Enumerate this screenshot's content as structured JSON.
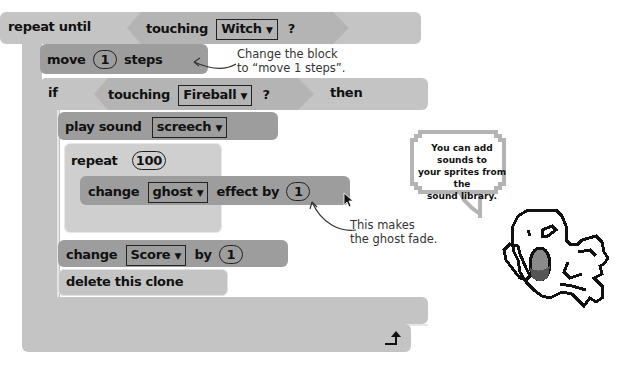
{
  "script": {
    "repeat_until": {
      "label": "repeat until",
      "condition": {
        "label": "touching",
        "target": "Witch",
        "suffix": "?"
      }
    },
    "move": {
      "label": "move",
      "value": "1",
      "suffix": "steps"
    },
    "if_block": {
      "label": "if",
      "condition": {
        "label": "touching",
        "target": "Fireball",
        "suffix": "?"
      },
      "then_label": "then"
    },
    "play_sound": {
      "label": "play sound",
      "sound": "screech"
    },
    "repeat": {
      "label": "repeat",
      "value": "100"
    },
    "change_effect": {
      "label": "change",
      "effect": "ghost",
      "middle": "effect by",
      "value": "1"
    },
    "change_var": {
      "label": "change",
      "variable": "Score",
      "middle": "by",
      "value": "1"
    },
    "delete_clone": {
      "label": "delete this clone"
    }
  },
  "annotations": {
    "move_note_line1": "Change the block",
    "move_note_line2": "to “move 1 steps”.",
    "fade_note_line1": "This makes",
    "fade_note_line2": "the ghost fade."
  },
  "speech_bubble": {
    "line1": "You can add sounds to",
    "line2": "your sprites from the",
    "line3": "sound library."
  },
  "icons": {
    "dropdown": "▼",
    "loop_arrow": "loop-arrow-icon"
  },
  "colors": {
    "control_block": "#c4c4c4",
    "sensing_block": "#b4b4b4",
    "motion_block": "#9d9d9d",
    "stroke": "#111111"
  }
}
